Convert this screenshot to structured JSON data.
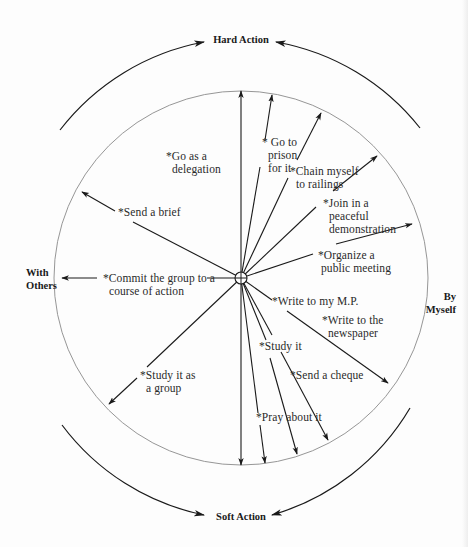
{
  "axes": {
    "top": "Hard Action",
    "bottom": "Soft Action",
    "left": "With\nOthers",
    "right": "By\nMyself"
  },
  "actions": [
    {
      "id": "go-as-delegation",
      "text": "*Go as a\n  delegation"
    },
    {
      "id": "go-to-prison",
      "text": "* Go to\n  prison\n  for it"
    },
    {
      "id": "chain-myself",
      "text": "*Chain myself\n  to railings"
    },
    {
      "id": "join-demonstration",
      "text": "*Join in a\n  peaceful\n  demonstration"
    },
    {
      "id": "organize-meeting",
      "text": "*Organize a\n public meeting"
    },
    {
      "id": "send-brief",
      "text": "*Send a brief"
    },
    {
      "id": "commit-group",
      "text": "*Commit the group to a\n  course of action"
    },
    {
      "id": "write-mp",
      "text": "*Write to my M.P."
    },
    {
      "id": "write-newspaper",
      "text": "*Write to the\n  newspaper"
    },
    {
      "id": "study-it",
      "text": "*Study it"
    },
    {
      "id": "study-group",
      "text": "*Study it as\n  a group"
    },
    {
      "id": "send-cheque",
      "text": "*Send a cheque"
    },
    {
      "id": "pray",
      "text": "*Pray about it"
    }
  ],
  "colors": {
    "line": "#1a1a1a",
    "circle": "#8a8a8a",
    "background": "#fdfdfd"
  }
}
